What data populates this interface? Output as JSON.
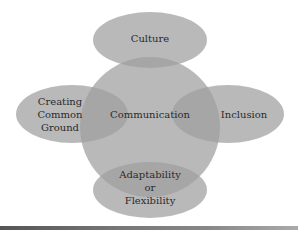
{
  "diagram": {
    "center": {
      "label": "Communication"
    },
    "nodes": [
      {
        "id": "culture",
        "lines": [
          "Culture"
        ]
      },
      {
        "id": "creating-common-ground",
        "lines": [
          "Creating",
          "Common",
          "Ground"
        ]
      },
      {
        "id": "inclusion",
        "lines": [
          "Inclusion"
        ]
      },
      {
        "id": "adaptability",
        "lines": [
          "Adaptability",
          "or",
          "Flexibility"
        ]
      }
    ]
  },
  "colors": {
    "shape_fill": "#a8a8a8",
    "overlap": "#8f8f8f",
    "text": "#2a2a2a"
  }
}
